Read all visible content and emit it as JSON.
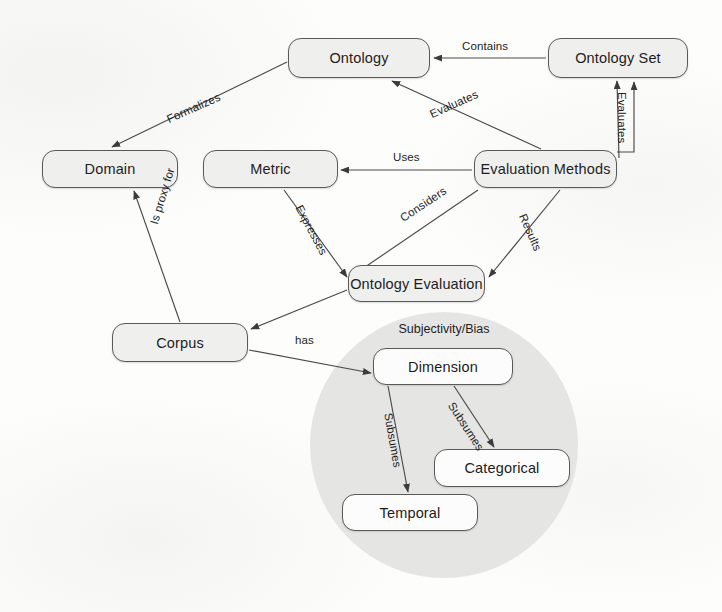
{
  "diagram": {
    "type": "concept-map",
    "canvas": {
      "width": 722,
      "height": 612
    },
    "colors": {
      "node_fill": "#efefee",
      "node_fill_plain": "#fcfcfc",
      "node_border": "#5a5a5a",
      "group_fill": "#e3e3e1",
      "text": "#1d1d1d",
      "edge": "#4a4a4a",
      "background": "#fdfdfc"
    },
    "nodes": [
      {
        "id": "ontology",
        "label": "Ontology",
        "x": 288,
        "y": 38,
        "w": 142,
        "h": 40,
        "shaded": true
      },
      {
        "id": "ontology-set",
        "label": "Ontology Set",
        "x": 548,
        "y": 38,
        "w": 140,
        "h": 40,
        "shaded": true
      },
      {
        "id": "domain",
        "label": "Domain",
        "x": 42,
        "y": 150,
        "w": 136,
        "h": 38,
        "shaded": true
      },
      {
        "id": "metric",
        "label": "Metric",
        "x": 203,
        "y": 150,
        "w": 135,
        "h": 38,
        "shaded": true
      },
      {
        "id": "evaluation-methods",
        "label": "Evaluation Methods",
        "x": 474,
        "y": 150,
        "w": 143,
        "h": 38,
        "shaded": true
      },
      {
        "id": "ontology-evaluation",
        "label": "Ontology Evaluation",
        "x": 348,
        "y": 265,
        "w": 137,
        "h": 37,
        "shaded": true
      },
      {
        "id": "corpus",
        "label": "Corpus",
        "x": 112,
        "y": 323,
        "w": 136,
        "h": 39,
        "shaded": true
      },
      {
        "id": "dimension",
        "label": "Dimension",
        "x": 373,
        "y": 348,
        "w": 140,
        "h": 37,
        "shaded": false
      },
      {
        "id": "categorical",
        "label": "Categorical",
        "x": 434,
        "y": 449,
        "w": 136,
        "h": 38,
        "shaded": false
      },
      {
        "id": "temporal",
        "label": "Temporal",
        "x": 342,
        "y": 494,
        "w": 136,
        "h": 37,
        "shaded": false
      }
    ],
    "group": {
      "id": "subjectivity-bias",
      "label": "Subjectivity/Bias",
      "shape": "circle",
      "x": 310,
      "y": 312,
      "w": 268,
      "h": 266,
      "label_x": 386,
      "label_y": 322,
      "label_w": 116
    },
    "edges": [
      {
        "id": "contains",
        "label": "Contains",
        "from": "ontology-set",
        "to": "ontology",
        "x1": 546,
        "y1": 58,
        "x2": 434,
        "y2": 58,
        "lx": 462,
        "ly": 40,
        "rot": 0
      },
      {
        "id": "evaluates-1",
        "label": "Evaluates",
        "from": "evaluation-methods",
        "to": "ontology",
        "x1": 541,
        "y1": 149,
        "x2": 392,
        "y2": 81,
        "lx": 428,
        "ly": 109,
        "rot": -24
      },
      {
        "id": "evaluates-2",
        "label": "Evaluates",
        "from": "evaluation-methods",
        "to": "ontology-set",
        "x1": 619,
        "y1": 158,
        "x2": 617,
        "y2": 81,
        "lx": 628,
        "ly": 92,
        "rot": 90
      },
      {
        "id": "formalizes",
        "label": "Formalizes",
        "from": "ontology",
        "to": "domain",
        "x1": 287,
        "y1": 62,
        "x2": 112,
        "y2": 147,
        "lx": 165,
        "ly": 114,
        "rot": -24
      },
      {
        "id": "uses",
        "label": "Uses",
        "from": "evaluation-methods",
        "to": "metric",
        "x1": 472,
        "y1": 170,
        "x2": 341,
        "y2": 170,
        "lx": 393,
        "ly": 151,
        "rot": 0
      },
      {
        "id": "expresses",
        "label": "Expresses",
        "from": "metric",
        "to": "ontology-evaluation",
        "x1": 284,
        "y1": 190,
        "x2": 347,
        "y2": 277,
        "lx": 304,
        "ly": 203,
        "rot": 62
      },
      {
        "id": "considers",
        "label": "Considers",
        "from": "evaluation-methods",
        "to": "ontology-evaluation",
        "x1": 478,
        "y1": 190,
        "x2": 349,
        "y2": 278,
        "lx": 398,
        "ly": 214,
        "rot": -34
      },
      {
        "id": "results",
        "label": "Results",
        "from": "evaluation-methods",
        "to": "ontology-evaluation",
        "x1": 560,
        "y1": 190,
        "x2": 489,
        "y2": 277,
        "lx": 528,
        "ly": 212,
        "rot": 66
      },
      {
        "id": "is-proxy-for",
        "label": "Is proxy for",
        "from": "corpus",
        "to": "domain",
        "x1": 180,
        "y1": 322,
        "x2": 134,
        "y2": 191,
        "lx": 148,
        "ly": 222,
        "rot": -73
      },
      {
        "id": "considers-corpus",
        "label": "",
        "from": "ontology-evaluation",
        "to": "corpus",
        "x1": 347,
        "y1": 290,
        "x2": 251,
        "y2": 329,
        "lx": 0,
        "ly": 0,
        "rot": 0
      },
      {
        "id": "has",
        "label": "has",
        "from": "corpus",
        "to": "dimension",
        "x1": 249,
        "y1": 350,
        "x2": 371,
        "y2": 373,
        "lx": 295,
        "ly": 334,
        "rot": 0
      },
      {
        "id": "subsumes-temporal",
        "label": "Subsumes",
        "from": "dimension",
        "to": "temporal",
        "x1": 388,
        "y1": 386,
        "x2": 408,
        "y2": 492,
        "lx": 394,
        "ly": 412,
        "rot": 80
      },
      {
        "id": "subsumes-categorical",
        "label": "Subsumes",
        "from": "dimension",
        "to": "categorical",
        "x1": 454,
        "y1": 386,
        "x2": 494,
        "y2": 447,
        "lx": 456,
        "ly": 400,
        "rot": 57
      }
    ]
  }
}
